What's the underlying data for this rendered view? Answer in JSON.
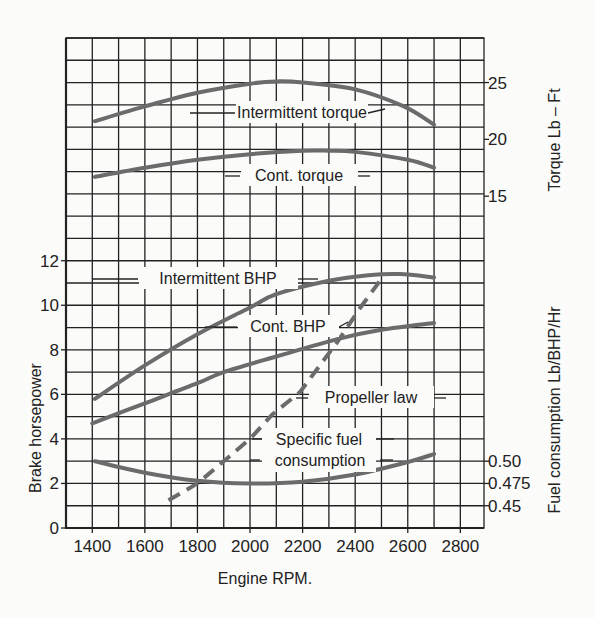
{
  "chart_data": {
    "type": "line",
    "title": "",
    "xlabel": "Engine RPM.",
    "ylabel_left": "Brake horsepower",
    "ylabel_right_top": "Torque Lb – Ft",
    "ylabel_right_bottom": "Fuel consumption Lb/BHP/Hr",
    "xlim": [
      1300,
      2890
    ],
    "x_ticks": [
      1400,
      1600,
      1800,
      2000,
      2200,
      2400,
      2600,
      2800
    ],
    "x_tick_labels": [
      "1400",
      "1600",
      "1800",
      "2000",
      "2200",
      "2400",
      "2600",
      "2800"
    ],
    "x_grid_step": 100,
    "bhp_axis": {
      "ylim": [
        0,
        22
      ],
      "ticks": [
        0,
        2,
        4,
        6,
        8,
        10,
        12
      ],
      "tick_labels": [
        "0",
        "2",
        "4",
        "6",
        "8",
        "10",
        "12"
      ],
      "grid_step": 1
    },
    "torque_axis": {
      "ticks": [
        15,
        20,
        25
      ],
      "tick_labels": [
        "15",
        "20",
        "25"
      ],
      "bhp_equivalent_of_25": 20,
      "units_per_bhp_grid": 1.96
    },
    "fuel_axis": {
      "ticks": [
        0.45,
        0.475,
        0.5
      ],
      "tick_labels": [
        "0.45",
        "0.475",
        "0.50"
      ],
      "bhp_equivalent_of_0_50": 3,
      "units_per_bhp_grid": 0.025
    },
    "grid": true,
    "series": [
      {
        "name": "Intermittent torque",
        "axis": "torque",
        "style": "solid",
        "x": [
          1410,
          1600,
          1800,
          2000,
          2100,
          2200,
          2400,
          2585,
          2700
        ],
        "values": [
          21.6,
          22.9,
          24.1,
          24.9,
          25.1,
          25.0,
          24.4,
          22.9,
          21.3
        ]
      },
      {
        "name": "Cont. torque",
        "axis": "torque",
        "style": "solid",
        "x": [
          1410,
          1600,
          1800,
          2000,
          2200,
          2300,
          2400,
          2600,
          2700
        ],
        "values": [
          16.7,
          17.5,
          18.2,
          18.7,
          19.0,
          19.0,
          18.9,
          18.2,
          17.5
        ]
      },
      {
        "name": "Intermittent BHP",
        "axis": "bhp",
        "style": "solid",
        "x": [
          1410,
          1600,
          1800,
          2000,
          2100,
          2300,
          2450,
          2570,
          2700
        ],
        "values": [
          5.8,
          7.3,
          8.7,
          9.9,
          10.5,
          11.1,
          11.35,
          11.4,
          11.25
        ]
      },
      {
        "name": "Cont. BHP",
        "axis": "bhp",
        "style": "solid",
        "x": [
          1400,
          1600,
          1800,
          1900,
          2100,
          2340,
          2500,
          2700
        ],
        "values": [
          4.7,
          5.6,
          6.5,
          7.0,
          7.7,
          8.5,
          8.9,
          9.2
        ]
      },
      {
        "name": "Propeller law",
        "axis": "bhp",
        "style": "dashed",
        "x": [
          1690,
          1800,
          1900,
          2000,
          2085,
          2190,
          2335,
          2420,
          2510
        ],
        "values": [
          1.25,
          2.0,
          3.0,
          4.0,
          5.1,
          6.1,
          8.4,
          9.9,
          11.35
        ]
      },
      {
        "name": "Specific fuel consumption",
        "axis": "fuel",
        "style": "solid",
        "x": [
          1410,
          1600,
          1800,
          2000,
          2200,
          2400,
          2600,
          2700
        ],
        "values": [
          0.5,
          0.487,
          0.478,
          0.475,
          0.477,
          0.485,
          0.499,
          0.508
        ]
      }
    ],
    "annotations": [
      {
        "text": "Intermittent torque",
        "series": "Intermittent torque"
      },
      {
        "text": "Cont. torque",
        "series": "Cont. torque"
      },
      {
        "text": "Intermittent BHP",
        "series": "Intermittent BHP"
      },
      {
        "text": "Cont. BHP",
        "series": "Cont. BHP"
      },
      {
        "text": "Propeller law",
        "series": "Propeller law"
      },
      {
        "text": "Specific fuel",
        "series": "Specific fuel consumption"
      },
      {
        "text": "consumption",
        "series": "Specific fuel consumption"
      }
    ]
  }
}
